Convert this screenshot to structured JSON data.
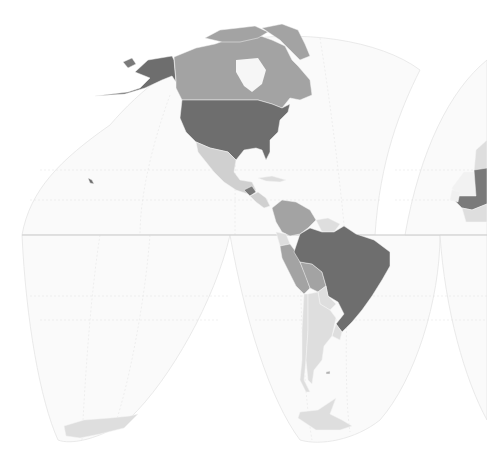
{
  "map": {
    "projection": "interrupted-homolosine",
    "region_visible": "Americas",
    "background": "#ffffff",
    "ocean_fill": "#fafafa",
    "equator_color": "#c8c8c8",
    "classes": {
      "darkest": "#6e6e6e",
      "dark": "#7a7a7a",
      "medium": "#a3a3a3",
      "light": "#d0d0d0",
      "lightest": "#dedede"
    },
    "countries": [
      {
        "name": "United States",
        "shade": "darkest"
      },
      {
        "name": "Alaska",
        "shade": "darkest"
      },
      {
        "name": "Canada",
        "shade": "medium"
      },
      {
        "name": "Greenland",
        "shade": "medium"
      },
      {
        "name": "Mexico",
        "shade": "light"
      },
      {
        "name": "Guatemala",
        "shade": "dark"
      },
      {
        "name": "Colombia",
        "shade": "medium"
      },
      {
        "name": "Venezuela",
        "shade": "medium"
      },
      {
        "name": "Guyana region",
        "shade": "lightest"
      },
      {
        "name": "Ecuador",
        "shade": "lightest"
      },
      {
        "name": "Peru",
        "shade": "medium"
      },
      {
        "name": "Bolivia",
        "shade": "medium"
      },
      {
        "name": "Brazil",
        "shade": "darkest"
      },
      {
        "name": "Paraguay",
        "shade": "lightest"
      },
      {
        "name": "Chile",
        "shade": "lightest"
      },
      {
        "name": "Argentina",
        "shade": "lightest"
      },
      {
        "name": "Uruguay",
        "shade": "lightest"
      },
      {
        "name": "Antarctica",
        "shade": "lightest"
      },
      {
        "name": "Western Sahara",
        "shade": "lightest"
      },
      {
        "name": "Mali",
        "shade": "dark"
      },
      {
        "name": "Mauritania",
        "shade": "lightest"
      },
      {
        "name": "Guinea region",
        "shade": "lightest"
      }
    ]
  }
}
